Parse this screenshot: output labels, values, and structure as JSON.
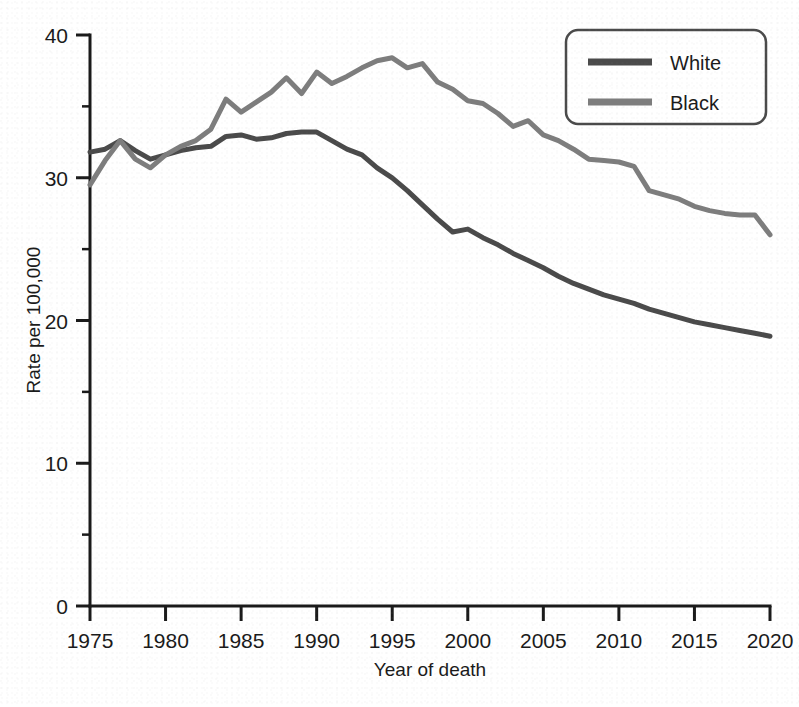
{
  "chart_data": {
    "type": "line",
    "title": "",
    "xlabel": "Year of death",
    "ylabel": "Rate per 100,000",
    "xlim": [
      1975,
      2020
    ],
    "ylim": [
      0,
      40
    ],
    "xticks": [
      1975,
      1980,
      1985,
      1990,
      1995,
      2000,
      2005,
      2010,
      2015,
      2020
    ],
    "xtick_labels": [
      "1975",
      "1980",
      "1985",
      "1990",
      "1995",
      "2000",
      "2005",
      "2010",
      "2015",
      "2020"
    ],
    "yticks": [
      0,
      10,
      20,
      30,
      40
    ],
    "ytick_labels": [
      "0",
      "10",
      "20",
      "30",
      "40"
    ],
    "yticks_minor": [
      5,
      15,
      25,
      35
    ],
    "xticks_minor_step": 1,
    "grid": false,
    "legend_position": "top-right",
    "x": [
      1975,
      1976,
      1977,
      1978,
      1979,
      1980,
      1981,
      1982,
      1983,
      1984,
      1985,
      1986,
      1987,
      1988,
      1989,
      1990,
      1991,
      1992,
      1993,
      1994,
      1995,
      1996,
      1997,
      1998,
      1999,
      2000,
      2001,
      2002,
      2003,
      2004,
      2005,
      2006,
      2007,
      2008,
      2009,
      2010,
      2011,
      2012,
      2013,
      2014,
      2015,
      2016,
      2017,
      2018,
      2019,
      2020
    ],
    "series": [
      {
        "name": "White",
        "color": "#4a4a4a",
        "values": [
          31.8,
          32.0,
          32.6,
          31.9,
          31.3,
          31.6,
          31.9,
          32.1,
          32.2,
          32.9,
          33.0,
          32.7,
          32.8,
          33.1,
          33.2,
          33.2,
          32.6,
          32.0,
          31.6,
          30.7,
          30.0,
          29.1,
          28.1,
          27.1,
          26.2,
          26.4,
          25.8,
          25.3,
          24.7,
          24.2,
          23.7,
          23.1,
          22.6,
          22.2,
          21.8,
          21.5,
          21.2,
          20.8,
          20.5,
          20.2,
          19.9,
          19.7,
          19.5,
          19.3,
          19.1,
          18.9
        ]
      },
      {
        "name": "Black",
        "color": "#7d7d7d",
        "values": [
          29.5,
          31.2,
          32.6,
          31.3,
          30.7,
          31.6,
          32.2,
          32.6,
          33.4,
          35.5,
          34.6,
          35.3,
          36.0,
          37.0,
          35.9,
          37.4,
          36.6,
          37.1,
          37.7,
          38.2,
          38.4,
          37.7,
          38.0,
          36.7,
          36.2,
          35.4,
          35.2,
          34.5,
          33.6,
          34.0,
          33.0,
          32.6,
          32.0,
          31.3,
          31.2,
          31.1,
          30.8,
          29.1,
          28.8,
          28.5,
          28.0,
          27.7,
          27.5,
          27.4,
          27.4,
          26.0
        ]
      }
    ]
  },
  "legend": {
    "items": [
      {
        "label": "White"
      },
      {
        "label": "Black"
      }
    ]
  }
}
